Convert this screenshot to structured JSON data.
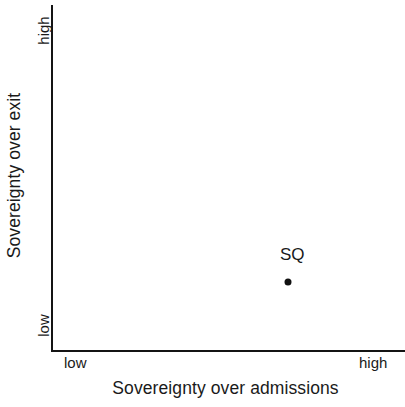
{
  "chart_data": {
    "type": "scatter",
    "title": "",
    "xlabel": "Sovereignty over admissions",
    "ylabel": "Sovereignty over exit",
    "x_tick_labels": [
      "low",
      "high"
    ],
    "y_tick_labels": [
      "low",
      "high"
    ],
    "xlim": [
      0,
      1
    ],
    "ylim": [
      0,
      1
    ],
    "grid": false,
    "legend": "none",
    "axis_color": "#141414",
    "text_color": "#1a1a1a",
    "background": "#ffffff",
    "point_color": "#111111",
    "points": [
      {
        "label": "SQ",
        "x": 0.67,
        "y": 0.2,
        "x_level": "high",
        "y_level": "low",
        "label_position": "above"
      }
    ],
    "series": [
      {
        "name": "Status quo",
        "values": [
          {
            "label": "SQ",
            "x": 0.67,
            "y": 0.2
          }
        ]
      }
    ]
  },
  "axes": {
    "x": {
      "title": "Sovereignty over admissions",
      "low_label": "low",
      "high_label": "high"
    },
    "y": {
      "title": "Sovereignty over exit",
      "low_label": "low",
      "high_label": "high"
    }
  }
}
